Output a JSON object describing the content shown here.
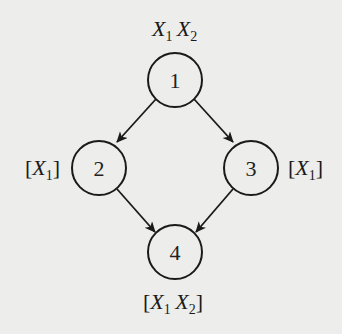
{
  "diagram": {
    "type": "directed-graph",
    "background_color": "#ededeb",
    "stroke_color": "#1a1a1a",
    "nodes": [
      {
        "id": "1",
        "label": "1",
        "annotation": {
          "bracketed": false,
          "vars": [
            {
              "name": "X",
              "sub": "1"
            },
            {
              "name": "X",
              "sub": "2"
            }
          ]
        }
      },
      {
        "id": "2",
        "label": "2",
        "annotation": {
          "bracketed": true,
          "vars": [
            {
              "name": "X",
              "sub": "1"
            }
          ]
        }
      },
      {
        "id": "3",
        "label": "3",
        "annotation": {
          "bracketed": true,
          "vars": [
            {
              "name": "X",
              "sub": "1"
            }
          ]
        }
      },
      {
        "id": "4",
        "label": "4",
        "annotation": {
          "bracketed": true,
          "vars": [
            {
              "name": "X",
              "sub": "1"
            },
            {
              "name": "X",
              "sub": "2"
            }
          ]
        }
      }
    ],
    "edges": [
      {
        "from": "1",
        "to": "2"
      },
      {
        "from": "1",
        "to": "3"
      },
      {
        "from": "2",
        "to": "4"
      },
      {
        "from": "3",
        "to": "4"
      }
    ],
    "brackets": {
      "open": "[",
      "close": "]"
    }
  }
}
